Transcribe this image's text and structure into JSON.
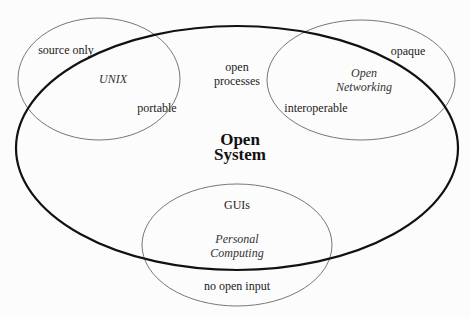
{
  "diagram": {
    "main": {
      "title_line1": "Open",
      "title_line2": "System"
    },
    "circles": [
      {
        "name": "UNIX",
        "inside_label": "portable",
        "outside_label": "source only"
      },
      {
        "name_line1": "Open",
        "name_line2": "Networking",
        "inside_label": "interoperable",
        "outside_label": "opaque"
      },
      {
        "name_line1": "Personal",
        "name_line2": "Computing",
        "inside_label": "GUIs",
        "outside_label": "no open input"
      }
    ],
    "center_label_line1": "open",
    "center_label_line2": "processes"
  }
}
